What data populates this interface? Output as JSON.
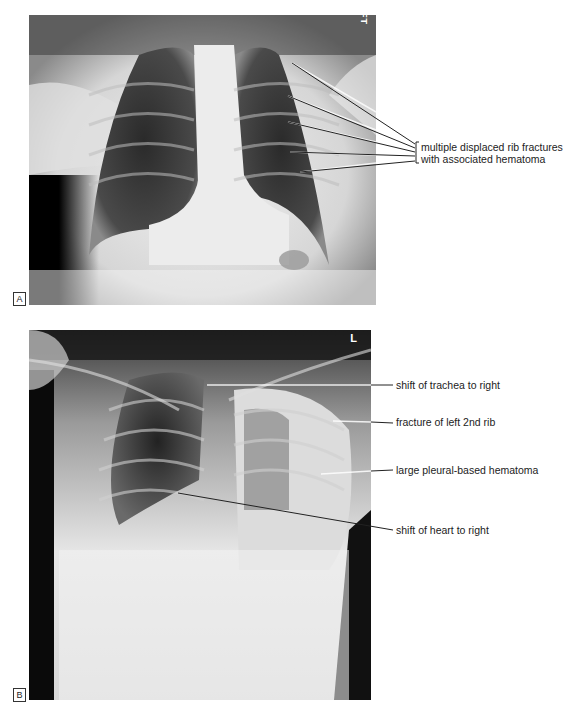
{
  "figure": {
    "panel_a": {
      "label": "A",
      "marker": "LEFT",
      "annotation": {
        "line1": "multiple displaced rib fractures",
        "line2": "with associated hematoma"
      }
    },
    "panel_b": {
      "label": "B",
      "marker": "L",
      "annotations": [
        {
          "text": "shift of trachea to right"
        },
        {
          "text": "fracture of left 2nd rib"
        },
        {
          "text": "large pleural-based hematoma"
        },
        {
          "text": "shift of heart to right"
        }
      ]
    }
  }
}
